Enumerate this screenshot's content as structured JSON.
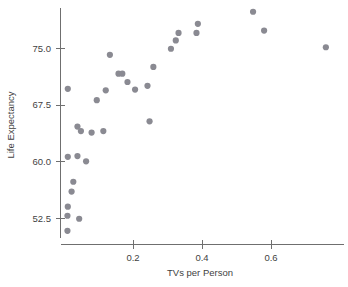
{
  "chart_data": {
    "type": "scatter",
    "title": "",
    "xlabel": "TVs per Person",
    "ylabel": "Life Expectancy",
    "xlim": [
      -0.01,
      0.82
    ],
    "ylim": [
      50.5,
      80.5
    ],
    "grid": false,
    "legend": null,
    "xticks": [
      0.2,
      0.4,
      0.6
    ],
    "xtick_labels": [
      "0.2",
      "0.4",
      "0.6"
    ],
    "yticks": [
      52.5,
      60.0,
      67.5,
      75.0
    ],
    "ytick_labels": [
      "52.5",
      "60.0",
      "67.5",
      "75.0"
    ],
    "marker": {
      "shape": "circle",
      "color": "#8a8a92",
      "size": 3.1
    },
    "points": [
      {
        "x": 0.011,
        "y": 69.6
      },
      {
        "x": 0.121,
        "y": 69.4
      },
      {
        "x": 0.095,
        "y": 68.1
      },
      {
        "x": 0.039,
        "y": 64.6
      },
      {
        "x": 0.049,
        "y": 64.0
      },
      {
        "x": 0.08,
        "y": 63.8
      },
      {
        "x": 0.114,
        "y": 64.0
      },
      {
        "x": 0.011,
        "y": 60.6
      },
      {
        "x": 0.039,
        "y": 60.7
      },
      {
        "x": 0.064,
        "y": 60.0
      },
      {
        "x": 0.027,
        "y": 57.3
      },
      {
        "x": 0.022,
        "y": 56.0
      },
      {
        "x": 0.011,
        "y": 54.0
      },
      {
        "x": 0.01,
        "y": 52.8
      },
      {
        "x": 0.044,
        "y": 52.4
      },
      {
        "x": 0.01,
        "y": 50.8
      },
      {
        "x": 0.133,
        "y": 74.1
      },
      {
        "x": 0.158,
        "y": 71.6
      },
      {
        "x": 0.169,
        "y": 71.6
      },
      {
        "x": 0.184,
        "y": 70.5
      },
      {
        "x": 0.206,
        "y": 69.5
      },
      {
        "x": 0.242,
        "y": 70.0
      },
      {
        "x": 0.259,
        "y": 72.5
      },
      {
        "x": 0.248,
        "y": 65.3
      },
      {
        "x": 0.31,
        "y": 74.9
      },
      {
        "x": 0.324,
        "y": 76.0
      },
      {
        "x": 0.332,
        "y": 77.0
      },
      {
        "x": 0.384,
        "y": 77.0
      },
      {
        "x": 0.388,
        "y": 78.2
      },
      {
        "x": 0.548,
        "y": 79.8
      },
      {
        "x": 0.58,
        "y": 77.3
      },
      {
        "x": 0.759,
        "y": 75.1
      }
    ]
  },
  "axes": {
    "y_axis_label": "Life Expectancy",
    "x_axis_label": "TVs per Person"
  }
}
